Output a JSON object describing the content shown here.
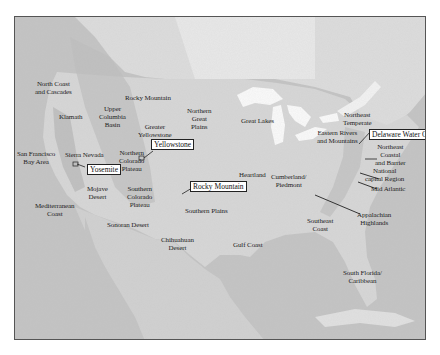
{
  "map": {
    "title": "",
    "colors": {
      "ocean": "#c3c3c3",
      "land": "#d6d6d6",
      "canada": "#e2e2e2",
      "lakes": "#fafafa",
      "mountains": "#b8b8b8",
      "border": "#555555"
    },
    "regions": [
      {
        "id": "north-coast-cascades",
        "label": "North Coast\nand Cascades"
      },
      {
        "id": "klamath",
        "label": "Klamath"
      },
      {
        "id": "upper-columbia-basin",
        "label": "Upper\nColumbia\nBasin"
      },
      {
        "id": "rocky-mountain-region",
        "label": "Rocky Mountain"
      },
      {
        "id": "greater-yellowstone",
        "label": "Greater\nYellowstone"
      },
      {
        "id": "northern-great-plains",
        "label": "Northern\nGreat\nPlains"
      },
      {
        "id": "great-lakes",
        "label": "Great Lakes"
      },
      {
        "id": "northeast-temperate",
        "label": "Northeast\nTemperate"
      },
      {
        "id": "eastern-rivers-mountains",
        "label": "Eastern Rivers\nand Mountains"
      },
      {
        "id": "northeast-coastal-barrier",
        "label": "Northeast\nCoastal\nand Barrier"
      },
      {
        "id": "national-capital-region",
        "label": "National\ncapital Region"
      },
      {
        "id": "mid-atlantic",
        "label": "Mid Atlantic"
      },
      {
        "id": "san-francisco-bay-area",
        "label": "San Francisco\nBay Area"
      },
      {
        "id": "sierra-nevada",
        "label": "Sierra Nevada"
      },
      {
        "id": "northern-colorado-plateau",
        "label": "Northern\nColorado\nPlateau"
      },
      {
        "id": "mojave-desert",
        "label": "Mojave\nDesert"
      },
      {
        "id": "southern-colorado-plateau",
        "label": "Southern\nColorado\nPlateau"
      },
      {
        "id": "mediterranean-coast",
        "label": "Mediterranean\nCoast"
      },
      {
        "id": "sonoran-desert",
        "label": "Sonoran Desert"
      },
      {
        "id": "chihuahuan-desert",
        "label": "Chihuahuan\nDesert"
      },
      {
        "id": "southern-plains",
        "label": "Southern Plains"
      },
      {
        "id": "heartland",
        "label": "Heartland"
      },
      {
        "id": "cumberland-piedmont",
        "label": "Cumberland/\nPiedmont"
      },
      {
        "id": "gulf-coast",
        "label": "Gulf Coast"
      },
      {
        "id": "southeast-coast",
        "label": "Southeast\nCoast"
      },
      {
        "id": "appalachian-highlands",
        "label": "Appalachian\nHighlands"
      },
      {
        "id": "south-florida-caribbean",
        "label": "South Florida/\nCaribbean"
      }
    ],
    "callouts": [
      {
        "id": "yellowstone",
        "label": "Yellowstone"
      },
      {
        "id": "rocky-mountain",
        "label": "Rocky Mountain"
      },
      {
        "id": "yosemite",
        "label": "Yosemite"
      },
      {
        "id": "delaware-water-gap",
        "label": "Delaware Water Gap"
      }
    ]
  }
}
